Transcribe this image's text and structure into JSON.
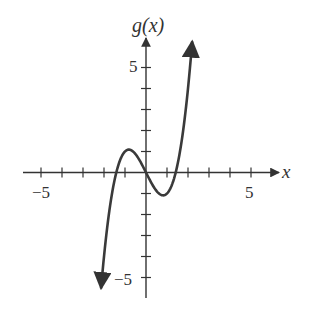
{
  "chart_data": {
    "type": "line",
    "title": "",
    "xlabel": "x",
    "ylabel": "g(x)",
    "function": "g(x) = x^3 - 2x",
    "xlim": [
      -6,
      6
    ],
    "ylim": [
      -6,
      7
    ],
    "x_tick_labels": [
      {
        "value": -5,
        "label": "−5"
      },
      {
        "value": 5,
        "label": "5"
      }
    ],
    "y_tick_labels": [
      {
        "value": 5,
        "label": "5"
      },
      {
        "value": -5,
        "label": "−5"
      }
    ],
    "x_ticks": [
      -5,
      -4,
      -3,
      -2,
      -1,
      1,
      2,
      3,
      4,
      5
    ],
    "y_ticks": [
      -5,
      -4,
      -3,
      -2,
      -1,
      1,
      2,
      3,
      4,
      5
    ],
    "grid": false,
    "series": [
      {
        "name": "g(x)",
        "x": [
          -2.14,
          -2.0,
          -1.8,
          -1.6,
          -1.414,
          -1.2,
          -1.0,
          -0.816,
          -0.6,
          -0.4,
          -0.2,
          0,
          0.2,
          0.4,
          0.6,
          0.816,
          1.0,
          1.2,
          1.414,
          1.6,
          1.8,
          2.0,
          2.2
        ],
        "y": [
          -5.52,
          -4.0,
          -2.23,
          -0.9,
          0.0,
          0.67,
          1.0,
          1.09,
          0.98,
          0.74,
          0.39,
          0,
          -0.39,
          -0.74,
          -0.98,
          -1.09,
          -1.0,
          -0.67,
          0.0,
          0.9,
          2.23,
          4.0,
          6.25
        ]
      }
    ],
    "key_points": {
      "local_max": [
        -0.816,
        1.09
      ],
      "local_min": [
        0.816,
        -1.09
      ],
      "roots": [
        -1.414,
        0,
        1.414
      ]
    }
  },
  "labels": {
    "y_axis": "g(x)",
    "x_axis": "x",
    "x_neg5": "−5",
    "x_pos5": "5",
    "y_pos5": "5",
    "y_neg5": "−5"
  },
  "colors": {
    "axis": "#333333",
    "curve": "#3a3a3a"
  }
}
